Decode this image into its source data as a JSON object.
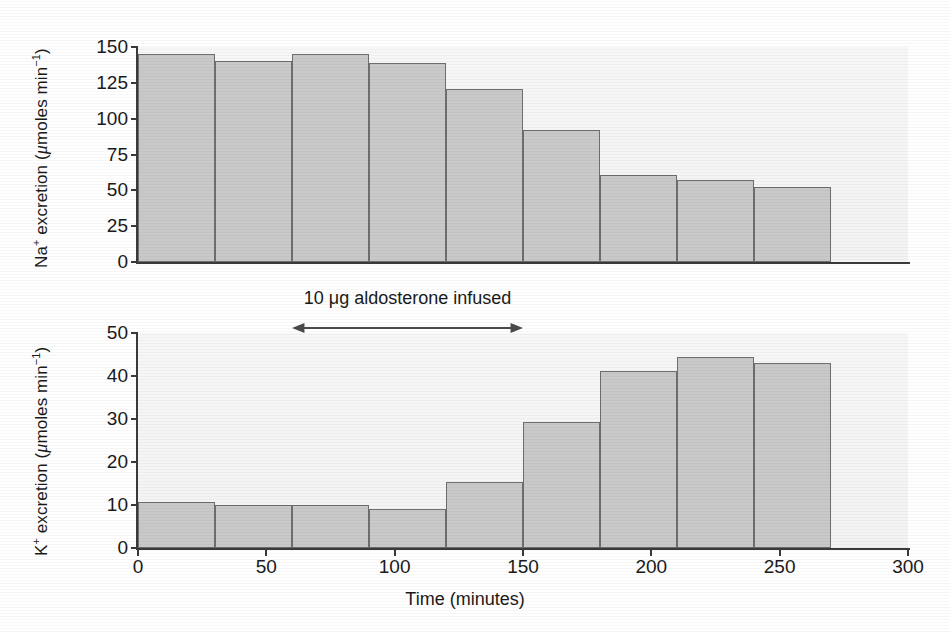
{
  "figure": {
    "xaxis_title": "Time (minutes)",
    "xticks": [
      0,
      50,
      100,
      150,
      200,
      250,
      300
    ],
    "xlim": [
      0,
      300
    ],
    "annotation": {
      "text": "10 μg aldosterone infused",
      "start": 60,
      "end": 150,
      "icon": "double-headed-arrow-icon"
    },
    "panels": [
      {
        "id": "na",
        "ylabel_prefix": "Na",
        "ylabel_sup": "+",
        "ylabel_mid": " excretion (",
        "ylabel_unit_mu": "μ",
        "ylabel_unit_rest": "moles min",
        "ylabel_unit_sup": "−1",
        "ylabel_close": ")",
        "yticks": [
          150,
          125,
          100,
          75,
          50,
          25,
          0
        ],
        "ylim": [
          0,
          150
        ]
      },
      {
        "id": "k",
        "ylabel_prefix": "K",
        "ylabel_sup": "+",
        "ylabel_mid": " excretion (",
        "ylabel_unit_mu": "μ",
        "ylabel_unit_rest": "moles min",
        "ylabel_unit_sup": "−1",
        "ylabel_close": ")",
        "yticks": [
          50,
          40,
          30,
          20,
          10,
          0
        ],
        "ylim": [
          0,
          50
        ]
      }
    ]
  },
  "chart_data": [
    {
      "type": "bar",
      "id": "na-excretion",
      "title": "",
      "xlabel": "Time (minutes)",
      "ylabel": "Na+ excretion (μmoles min−1)",
      "xlim": [
        0,
        300
      ],
      "ylim": [
        0,
        150
      ],
      "yticks": [
        0,
        25,
        50,
        75,
        100,
        125,
        150
      ],
      "xticks": [
        0,
        50,
        100,
        150,
        200,
        250,
        300
      ],
      "bar_width": 30,
      "bin_edges": [
        0,
        30,
        60,
        90,
        120,
        150,
        180,
        210,
        240,
        270
      ],
      "categories": [
        "0–30",
        "30–60",
        "60–90",
        "90–120",
        "120–150",
        "150–180",
        "180–210",
        "210–240",
        "240–270"
      ],
      "x": [
        15,
        45,
        75,
        105,
        135,
        165,
        195,
        225,
        255
      ],
      "values": [
        145,
        140,
        145,
        139,
        121,
        92,
        61,
        57,
        52
      ],
      "grid": false,
      "legend": "none",
      "fill_color": "#c9c9c9",
      "edge_color": "#6e6e6e"
    },
    {
      "type": "bar",
      "id": "k-excretion",
      "title": "",
      "xlabel": "Time (minutes)",
      "ylabel": "K+ excretion (μmoles min−1)",
      "xlim": [
        0,
        300
      ],
      "ylim": [
        0,
        50
      ],
      "yticks": [
        0,
        10,
        20,
        30,
        40,
        50
      ],
      "xticks": [
        0,
        50,
        100,
        150,
        200,
        250,
        300
      ],
      "bar_width": 30,
      "bin_edges": [
        0,
        30,
        60,
        90,
        120,
        150,
        180,
        210,
        240,
        270
      ],
      "categories": [
        "0–30",
        "30–60",
        "60–90",
        "90–120",
        "120–150",
        "150–180",
        "180–210",
        "210–240",
        "240–270"
      ],
      "x": [
        15,
        45,
        75,
        105,
        135,
        165,
        195,
        225,
        255
      ],
      "values": [
        10.7,
        10.0,
        10.0,
        9.0,
        15.3,
        29.3,
        41.2,
        44.5,
        43.0
      ],
      "grid": false,
      "legend": "none",
      "annotations": [
        {
          "text": "10 μg aldosterone infused",
          "x_start": 60,
          "x_end": 150,
          "type": "double-arrow"
        }
      ],
      "fill_color": "#c9c9c9",
      "edge_color": "#6e6e6e"
    }
  ]
}
